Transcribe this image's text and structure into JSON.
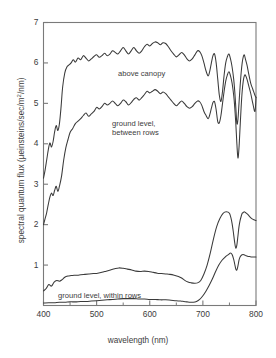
{
  "chart_data": {
    "type": "line",
    "title": "",
    "xlabel": "wavelength (nm)",
    "ylabel": "spectral quantum flux (µeinsteins/sec/m²/nm)",
    "ylabel_parts": {
      "prefix": "spectral quantum flux (µeinsteins/sec/m",
      "sup": "2",
      "suffix": "/nm)"
    },
    "xlim": [
      400,
      800
    ],
    "ylim": [
      0,
      7
    ],
    "xticks": [
      400,
      500,
      600,
      700,
      800
    ],
    "xticks_minor": [
      450,
      550,
      650,
      750
    ],
    "yticks": [
      1,
      2,
      3,
      4,
      5,
      6,
      7
    ],
    "xtick_labels": [
      "400",
      "500",
      "600",
      "700",
      "800"
    ],
    "ytick_labels": [
      "1",
      "2",
      "3",
      "4",
      "5",
      "6",
      "7"
    ],
    "grid": false,
    "legend_position": "inline-annotations",
    "line_color": "#3a3a3a",
    "frame_color": "#7a7a7a",
    "background": "#ffffff",
    "series": [
      {
        "name": "above canopy",
        "label": "above canopy",
        "label_x": 118,
        "label_y": 69,
        "x": [
          400,
          403,
          406,
          409,
          412,
          415,
          418,
          421,
          424,
          427,
          430,
          433,
          436,
          440,
          444,
          448,
          452,
          456,
          460,
          465,
          470,
          475,
          480,
          485,
          490,
          495,
          500,
          505,
          510,
          515,
          520,
          525,
          530,
          535,
          540,
          545,
          550,
          555,
          560,
          565,
          570,
          575,
          580,
          585,
          590,
          595,
          600,
          605,
          610,
          615,
          620,
          625,
          630,
          635,
          640,
          645,
          650,
          655,
          660,
          665,
          670,
          675,
          680,
          685,
          690,
          694,
          698,
          702,
          706,
          710,
          713,
          716,
          719,
          722,
          725,
          728,
          731,
          734,
          737,
          740,
          743,
          746,
          749,
          752,
          755,
          758,
          760,
          762,
          764,
          766,
          768,
          770,
          772,
          774,
          776,
          778,
          780,
          783,
          786,
          790,
          794,
          798,
          800
        ],
        "values": [
          3.15,
          3.35,
          3.6,
          3.85,
          4.02,
          3.92,
          4.05,
          4.3,
          4.45,
          4.33,
          4.5,
          4.9,
          5.4,
          5.75,
          5.9,
          5.95,
          6.0,
          6.08,
          6.02,
          6.12,
          6.08,
          6.18,
          6.12,
          6.05,
          6.1,
          6.16,
          6.2,
          6.14,
          6.18,
          6.24,
          6.18,
          6.22,
          6.3,
          6.26,
          6.22,
          6.3,
          6.38,
          6.3,
          6.22,
          6.3,
          6.38,
          6.3,
          6.24,
          6.3,
          6.4,
          6.46,
          6.42,
          6.48,
          6.52,
          6.5,
          6.45,
          6.5,
          6.48,
          6.4,
          6.3,
          6.22,
          6.15,
          6.2,
          6.26,
          6.2,
          6.1,
          6.05,
          6.1,
          6.2,
          6.3,
          6.28,
          6.18,
          6.0,
          5.8,
          5.68,
          5.8,
          6.0,
          6.18,
          6.22,
          6.0,
          5.6,
          5.2,
          5.05,
          5.3,
          5.7,
          6.0,
          6.15,
          6.22,
          6.1,
          5.9,
          5.6,
          5.3,
          4.9,
          4.5,
          4.6,
          5.0,
          5.4,
          5.75,
          6.0,
          6.15,
          6.2,
          6.1,
          5.95,
          5.75,
          5.5,
          5.35,
          5.2,
          5.15
        ]
      },
      {
        "name": "ground level, between rows",
        "label": "ground level,\nbetween rows",
        "label_x": 112,
        "label_y": 119,
        "x": [
          400,
          403,
          406,
          409,
          412,
          415,
          418,
          421,
          424,
          427,
          430,
          434,
          438,
          442,
          446,
          450,
          455,
          460,
          465,
          470,
          475,
          480,
          485,
          490,
          495,
          500,
          505,
          510,
          515,
          520,
          525,
          530,
          535,
          540,
          545,
          550,
          555,
          560,
          565,
          570,
          575,
          580,
          585,
          590,
          595,
          600,
          605,
          610,
          615,
          620,
          625,
          630,
          635,
          640,
          645,
          650,
          655,
          660,
          665,
          670,
          675,
          680,
          685,
          690,
          694,
          698,
          702,
          706,
          710,
          713,
          716,
          719,
          722,
          725,
          728,
          731,
          734,
          737,
          740,
          743,
          746,
          749,
          752,
          755,
          758,
          760,
          762,
          764,
          766,
          768,
          770,
          772,
          774,
          776,
          778,
          780,
          783,
          786,
          790,
          794,
          798,
          800
        ],
        "values": [
          2.0,
          2.15,
          2.3,
          2.5,
          2.68,
          2.78,
          2.72,
          2.85,
          2.95,
          2.82,
          2.95,
          3.2,
          3.6,
          3.9,
          4.1,
          4.28,
          4.38,
          4.5,
          4.56,
          4.62,
          4.7,
          4.76,
          4.68,
          4.74,
          4.8,
          4.9,
          4.86,
          4.92,
          5.0,
          4.96,
          5.0,
          5.06,
          5.0,
          4.94,
          5.0,
          5.08,
          5.04,
          4.96,
          5.02,
          5.1,
          5.14,
          5.08,
          5.14,
          5.22,
          5.3,
          5.26,
          5.3,
          5.34,
          5.3,
          5.24,
          5.28,
          5.24,
          5.16,
          5.08,
          5.0,
          4.94,
          5.0,
          5.06,
          5.0,
          4.92,
          4.88,
          4.92,
          5.0,
          5.06,
          5.04,
          4.95,
          4.8,
          4.7,
          4.62,
          4.72,
          4.88,
          5.02,
          5.04,
          4.84,
          4.55,
          4.52,
          4.7,
          5.0,
          5.3,
          5.55,
          5.7,
          5.78,
          5.68,
          5.5,
          5.2,
          4.9,
          4.5,
          4.0,
          3.65,
          3.9,
          4.4,
          4.9,
          5.3,
          5.55,
          5.68,
          5.7,
          5.6,
          5.45,
          5.25,
          5.0,
          4.8,
          5.15
        ]
      },
      {
        "name": "ground level, within rows (upper)",
        "label": "ground level, within rows",
        "label_x": 58,
        "label_y": 291,
        "x": [
          400,
          405,
          410,
          415,
          420,
          425,
          430,
          435,
          440,
          446,
          452,
          458,
          464,
          470,
          478,
          486,
          494,
          502,
          510,
          518,
          526,
          534,
          542,
          550,
          558,
          566,
          574,
          582,
          590,
          598,
          606,
          614,
          622,
          630,
          638,
          646,
          654,
          660,
          666,
          672,
          678,
          684,
          690,
          696,
          702,
          708,
          714,
          720,
          726,
          732,
          738,
          744,
          750,
          754,
          757,
          760,
          762,
          764,
          766,
          768,
          770,
          772,
          774,
          776,
          778,
          780,
          784,
          788,
          792,
          796,
          800
        ],
        "values": [
          0.36,
          0.42,
          0.52,
          0.48,
          0.58,
          0.62,
          0.6,
          0.64,
          0.7,
          0.73,
          0.74,
          0.75,
          0.75,
          0.76,
          0.77,
          0.78,
          0.79,
          0.8,
          0.82,
          0.85,
          0.88,
          0.91,
          0.93,
          0.92,
          0.9,
          0.88,
          0.85,
          0.84,
          0.85,
          0.84,
          0.82,
          0.8,
          0.79,
          0.78,
          0.77,
          0.75,
          0.72,
          0.68,
          0.62,
          0.58,
          0.56,
          0.55,
          0.56,
          0.62,
          0.78,
          1.0,
          1.3,
          1.65,
          1.95,
          2.15,
          2.28,
          2.32,
          2.28,
          2.1,
          1.85,
          1.55,
          1.42,
          1.5,
          1.72,
          1.95,
          2.1,
          2.2,
          2.28,
          2.3,
          2.32,
          2.3,
          2.26,
          2.2,
          2.15,
          2.12,
          2.1
        ]
      },
      {
        "name": "ground level, within rows (lower)",
        "label": "",
        "label_x": 0,
        "label_y": 0,
        "x": [
          400,
          410,
          420,
          430,
          440,
          450,
          460,
          470,
          480,
          490,
          500,
          510,
          520,
          530,
          540,
          550,
          560,
          570,
          580,
          590,
          600,
          610,
          620,
          630,
          640,
          650,
          658,
          664,
          670,
          676,
          682,
          688,
          694,
          700,
          706,
          712,
          718,
          724,
          730,
          736,
          742,
          748,
          752,
          755,
          758,
          760,
          762,
          764,
          766,
          768,
          770,
          773,
          776,
          780,
          784,
          788,
          792,
          796,
          800
        ],
        "values": [
          0.06,
          0.07,
          0.07,
          0.08,
          0.08,
          0.09,
          0.09,
          0.1,
          0.1,
          0.11,
          0.12,
          0.13,
          0.14,
          0.15,
          0.16,
          0.17,
          0.17,
          0.17,
          0.16,
          0.16,
          0.15,
          0.15,
          0.14,
          0.14,
          0.13,
          0.12,
          0.11,
          0.1,
          0.09,
          0.08,
          0.08,
          0.1,
          0.15,
          0.24,
          0.36,
          0.5,
          0.66,
          0.84,
          1.0,
          1.12,
          1.2,
          1.26,
          1.3,
          1.26,
          1.14,
          1.02,
          0.9,
          0.88,
          0.98,
          1.12,
          1.2,
          1.25,
          1.26,
          1.24,
          1.22,
          1.21,
          1.2,
          1.2,
          1.2
        ]
      }
    ]
  }
}
